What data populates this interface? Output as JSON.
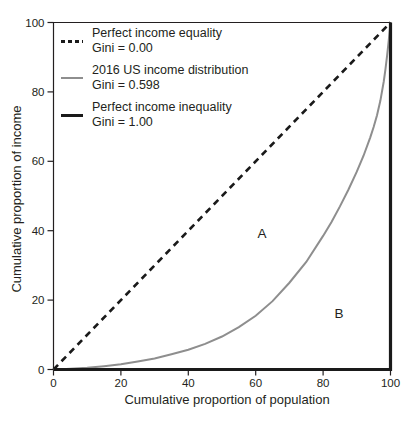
{
  "figure": {
    "background": "#ffffff",
    "text_color": "#231f20"
  },
  "axes": {
    "x_label": "Cumulative proportion of population",
    "y_label": "Cumulative proportion of income"
  },
  "chart_data": {
    "type": "line",
    "title": "",
    "xlabel": "Cumulative proportion of population",
    "ylabel": "Cumulative proportion of income",
    "xlim": [
      0,
      100
    ],
    "ylim": [
      0,
      100
    ],
    "x_ticks": [
      0,
      20,
      40,
      60,
      80,
      100
    ],
    "y_ticks": [
      0,
      20,
      40,
      60,
      80,
      100
    ],
    "grid": false,
    "legend_position": "upper-left-inside",
    "series": [
      {
        "name": "Perfect income equality",
        "gini_label": "Gini = 0.00",
        "gini": 0.0,
        "style": "dashed",
        "color": "#1a1a1a",
        "width": 2.6,
        "points": [
          [
            0,
            0
          ],
          [
            100,
            100
          ]
        ]
      },
      {
        "name": "2016 US income distribution",
        "gini_label": "Gini = 0.598",
        "gini": 0.598,
        "style": "solid",
        "color": "#8e8e8e",
        "width": 2,
        "points": [
          [
            0,
            0
          ],
          [
            2.5,
            0.1
          ],
          [
            5,
            0.2
          ],
          [
            7.5,
            0.35
          ],
          [
            10,
            0.5
          ],
          [
            15,
            0.95
          ],
          [
            20,
            1.5
          ],
          [
            25,
            2.3
          ],
          [
            30,
            3.2
          ],
          [
            35,
            4.4
          ],
          [
            40,
            5.7
          ],
          [
            45,
            7.4
          ],
          [
            50,
            9.5
          ],
          [
            55,
            12.2
          ],
          [
            60,
            15.5
          ],
          [
            65,
            19.7
          ],
          [
            70,
            25
          ],
          [
            75,
            31
          ],
          [
            80,
            38.5
          ],
          [
            82.5,
            42.5
          ],
          [
            85,
            47
          ],
          [
            87.5,
            51.8
          ],
          [
            90,
            57
          ],
          [
            92,
            61.6
          ],
          [
            94,
            66.9
          ],
          [
            95,
            69.9
          ],
          [
            96,
            73.3
          ],
          [
            97,
            77.5
          ],
          [
            98,
            83
          ],
          [
            98.5,
            86.5
          ],
          [
            99,
            90.5
          ],
          [
            99.5,
            95
          ],
          [
            100,
            100
          ]
        ]
      },
      {
        "name": "Perfect income inequality",
        "gini_label": "Gini = 1.00",
        "gini": 1.0,
        "style": "solid",
        "color": "#1a1a1a",
        "width": 3.2,
        "points": [
          [
            0,
            0
          ],
          [
            100,
            0
          ],
          [
            100,
            100
          ]
        ]
      }
    ],
    "annotations": [
      {
        "text": "A",
        "x": 62,
        "y": 39
      },
      {
        "text": "B",
        "x": 85,
        "y": 16
      }
    ]
  }
}
